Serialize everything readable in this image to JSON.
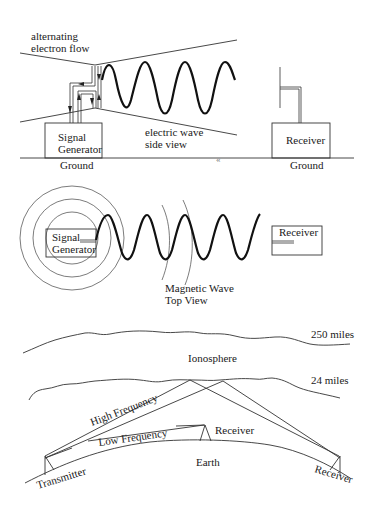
{
  "panel1": {
    "title_line1": "alternating",
    "title_line2": "electron flow",
    "signal_generator_line1": "Signal",
    "signal_generator_line2": "Generator",
    "wave_label_line1": "electric wave",
    "wave_label_line2": "side view",
    "receiver": "Receiver",
    "ground_left": "Ground",
    "ground_right": "Ground",
    "ground_break_symbol": "«"
  },
  "panel2": {
    "signal_generator_line1": "Signal",
    "signal_generator_line2": "Generator",
    "receiver": "Receiver",
    "wave_label_line1": "Magnetic Wave",
    "wave_label_line2": "Top View"
  },
  "panel3": {
    "upper_altitude": "250 miles",
    "layer_name": "Ionosphere",
    "lower_altitude": "24 miles",
    "high_frequency": "High Frequency",
    "low_frequency": "Low Frequency",
    "near_receiver": "Receiver",
    "earth": "Earth",
    "transmitter": "Transmitter",
    "far_receiver": "Receiver"
  }
}
